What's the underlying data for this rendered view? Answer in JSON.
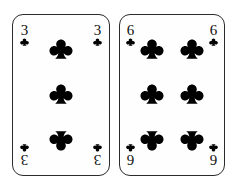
{
  "scene": {
    "title": "Two playing cards",
    "background_color": "#ffffff",
    "surface": "white"
  },
  "style": {
    "card_face_color": "#fefefe",
    "card_border_color": "#2b2b2b",
    "pip_color": "#000000",
    "rank_color": "#111111"
  },
  "cards": [
    {
      "name": "three-of-clubs",
      "rank": "3",
      "suit": "clubs",
      "suit_symbol": "♣",
      "color": "black",
      "pip_count": 3,
      "layout": "single-center-column",
      "corners": [
        {
          "position": "top-left",
          "rank": "3",
          "rotated": false
        },
        {
          "position": "top-right",
          "rank": "3",
          "rotated": false
        },
        {
          "position": "bottom-left",
          "rank": "3",
          "rotated": true
        },
        {
          "position": "bottom-right",
          "rank": "3",
          "rotated": true
        }
      ]
    },
    {
      "name": "six-of-clubs",
      "rank": "6",
      "suit": "clubs",
      "suit_symbol": "♣",
      "color": "black",
      "pip_count": 6,
      "layout": "two-columns-three-rows",
      "corners": [
        {
          "position": "top-left",
          "rank": "6",
          "rotated": false
        },
        {
          "position": "top-right",
          "rank": "6",
          "rotated": false
        },
        {
          "position": "bottom-left",
          "rank": "6",
          "rotated": true
        },
        {
          "position": "bottom-right",
          "rank": "6",
          "rotated": true
        }
      ]
    }
  ]
}
